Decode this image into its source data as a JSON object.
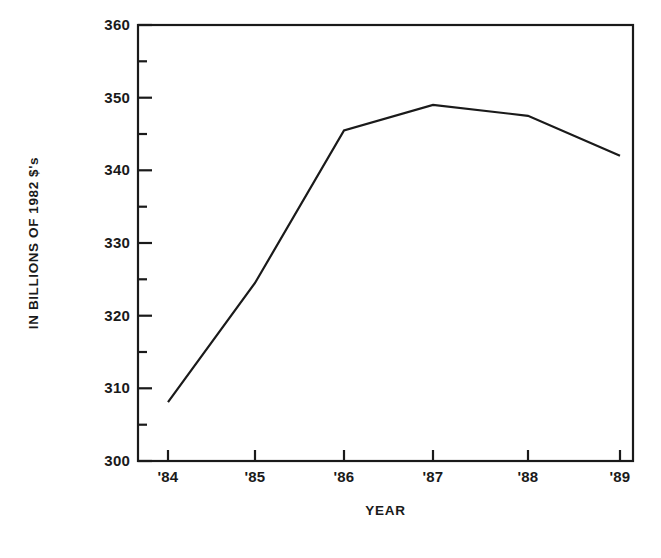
{
  "chart_data": {
    "type": "line",
    "title": "",
    "xlabel": "YEAR",
    "ylabel": "IN BILLIONS OF 1982 $'s",
    "categories": [
      "'84",
      "'85",
      "'86",
      "'87",
      "'88",
      "'89"
    ],
    "values": [
      308.1,
      324.5,
      345.5,
      349.0,
      347.5,
      342.0
    ],
    "series": [
      {
        "name": "IN BILLIONS OF 1982 $'s",
        "values": [
          308.1,
          324.5,
          345.5,
          349.0,
          347.5,
          342.0
        ]
      }
    ],
    "xlim": [
      "'84",
      "'89"
    ],
    "ylim": [
      300,
      360
    ],
    "y_ticks": [
      300,
      310,
      320,
      330,
      340,
      350,
      360
    ],
    "y_tick_labels": [
      "300",
      "310",
      "320",
      "330",
      "340",
      "350",
      "360"
    ],
    "y_minor_ticks": [
      305,
      315,
      325,
      335,
      345,
      355
    ],
    "x_tick_labels": [
      "'84",
      "'85",
      "'86",
      "'87",
      "'88",
      "'89"
    ],
    "grid": false,
    "legend": false,
    "line_color": "#1a1a1a",
    "frame_color": "#1a1a1a",
    "background_color": "#ffffff"
  }
}
